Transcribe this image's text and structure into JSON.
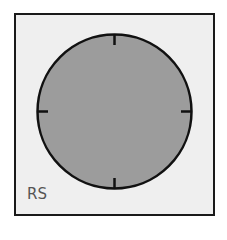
{
  "panel": {
    "label": "RS",
    "background_color": "#efefef",
    "border_color": "#1a1a1a"
  },
  "dial": {
    "fill_color": "#9c9c9c",
    "stroke_color": "#111111",
    "ticks": [
      "top",
      "right",
      "bottom",
      "left"
    ]
  }
}
